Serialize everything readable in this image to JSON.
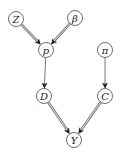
{
  "diagram": {
    "type": "directed-graph",
    "nodes": [
      {
        "id": "Z",
        "label": "Z",
        "x": 16,
        "y": 19
      },
      {
        "id": "beta",
        "label": "β",
        "x": 75,
        "y": 18
      },
      {
        "id": "p",
        "label": "p",
        "x": 46,
        "y": 50
      },
      {
        "id": "pi",
        "label": "π",
        "x": 105,
        "y": 50
      },
      {
        "id": "D",
        "label": "D",
        "x": 44,
        "y": 96
      },
      {
        "id": "C",
        "label": "C",
        "x": 105,
        "y": 96
      },
      {
        "id": "Y",
        "label": "Y",
        "x": 74,
        "y": 140
      }
    ],
    "edges": [
      {
        "from": "Z",
        "to": "p",
        "style": "double"
      },
      {
        "from": "beta",
        "to": "p",
        "style": "double"
      },
      {
        "from": "p",
        "to": "D",
        "style": "single"
      },
      {
        "from": "pi",
        "to": "C",
        "style": "single"
      },
      {
        "from": "D",
        "to": "Y",
        "style": "double"
      },
      {
        "from": "C",
        "to": "Y",
        "style": "double"
      }
    ],
    "colors": {
      "node_stroke": "#6e6e6e",
      "edge": "#777777",
      "arrowhead": "#222222"
    }
  }
}
